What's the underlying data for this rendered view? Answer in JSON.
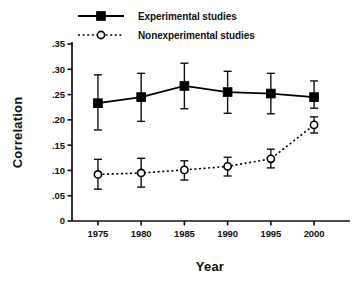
{
  "chart_data": {
    "type": "line",
    "title": "",
    "xlabel": "Year",
    "ylabel": "Correlation",
    "x": [
      1975,
      1980,
      1985,
      1990,
      1995,
      2000
    ],
    "categories": [
      "1975",
      "1980",
      "1985",
      "1990",
      "1995",
      "2000"
    ],
    "xlim": [
      1972,
      2003
    ],
    "ylim": [
      0,
      0.35
    ],
    "ytick_labels": [
      ".35",
      ".30",
      ".25",
      ".20",
      ".15",
      ".10",
      ".05",
      "0"
    ],
    "ytick_values": [
      0.35,
      0.3,
      0.25,
      0.2,
      0.15,
      0.1,
      0.05,
      0
    ],
    "xtick_labels": [
      "1975",
      "1980",
      "1985",
      "1990",
      "1995",
      "2000"
    ],
    "grid": false,
    "legend_position": "top-left",
    "series": [
      {
        "name": "Experimental studies",
        "marker": "filled-square",
        "line_style": "solid",
        "color": "#000000",
        "values": [
          0.233,
          0.245,
          0.267,
          0.255,
          0.252,
          0.245
        ],
        "error_low": [
          0.18,
          0.197,
          0.222,
          0.213,
          0.212,
          0.223
        ],
        "error_high": [
          0.289,
          0.292,
          0.312,
          0.296,
          0.292,
          0.277
        ]
      },
      {
        "name": "Nonexperimental studies",
        "marker": "open-circle",
        "line_style": "dotted",
        "color": "#000000",
        "values": [
          0.092,
          0.095,
          0.101,
          0.108,
          0.123,
          0.19
        ],
        "error_low": [
          0.063,
          0.067,
          0.081,
          0.089,
          0.105,
          0.174
        ],
        "error_high": [
          0.122,
          0.124,
          0.119,
          0.126,
          0.142,
          0.206
        ]
      }
    ]
  },
  "legend": {
    "items": [
      {
        "label": "Experimental studies"
      },
      {
        "label": "Nonexperimental studies"
      }
    ]
  }
}
